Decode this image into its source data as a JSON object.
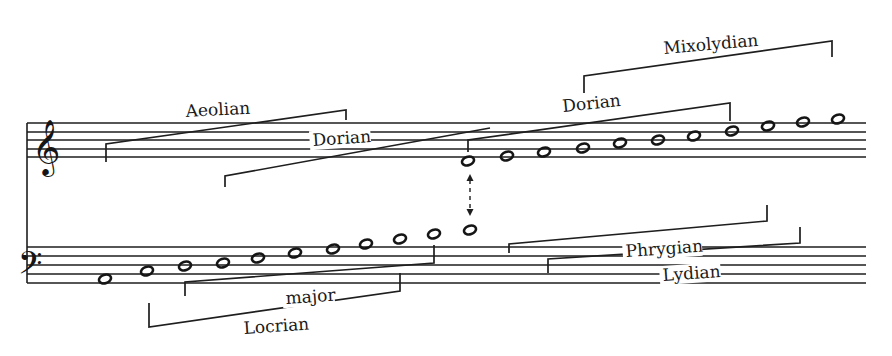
{
  "diagram": {
    "type": "music-notation-mode-diagram",
    "ink_color": "#1e1e1e",
    "background": "#ffffff",
    "clefs": [
      {
        "name": "treble",
        "glyph": "𝄞",
        "x": 46,
        "y": 163
      },
      {
        "name": "bass",
        "glyph": "𝄢",
        "x": 30,
        "y": 280
      }
    ],
    "staves": {
      "treble": {
        "x1": 27,
        "x2": 866,
        "lines_y": [
          123,
          132,
          140,
          149,
          157
        ]
      },
      "bass": {
        "x1": 27,
        "x2": 866,
        "lines_y": [
          247,
          256,
          265,
          274,
          283
        ]
      },
      "system_bar": {
        "x": 27,
        "y1": 123,
        "y2": 283
      }
    },
    "notes": {
      "treble": [
        {
          "x": 468,
          "y": 161
        },
        {
          "x": 507,
          "y": 156
        },
        {
          "x": 544,
          "y": 152
        },
        {
          "x": 583,
          "y": 148
        },
        {
          "x": 620,
          "y": 143
        },
        {
          "x": 658,
          "y": 140
        },
        {
          "x": 694,
          "y": 136
        },
        {
          "x": 732,
          "y": 131
        },
        {
          "x": 768,
          "y": 126
        },
        {
          "x": 803,
          "y": 122
        },
        {
          "x": 838,
          "y": 119
        }
      ],
      "bass": [
        {
          "x": 105,
          "y": 279
        },
        {
          "x": 147,
          "y": 271
        },
        {
          "x": 185,
          "y": 266
        },
        {
          "x": 223,
          "y": 263
        },
        {
          "x": 258,
          "y": 258
        },
        {
          "x": 295,
          "y": 253
        },
        {
          "x": 333,
          "y": 249
        },
        {
          "x": 366,
          "y": 244
        },
        {
          "x": 400,
          "y": 239
        },
        {
          "x": 434,
          "y": 234
        },
        {
          "x": 470,
          "y": 230
        }
      ]
    },
    "connector_arrow": {
      "x": 470,
      "y1": 174,
      "y2": 216,
      "style": "dashed-double-headed"
    },
    "modes": [
      {
        "label": "Aeolian",
        "points": "106,162 106,144 346,110 346,120",
        "label_x": 186,
        "label_y": 117,
        "label_rotate": -3
      },
      {
        "label": "Dorian",
        "points": "225,187 225,176 490,128",
        "label_x": 313,
        "label_y": 146,
        "label_rotate": -4
      },
      {
        "label": "Dorian",
        "points": "468,152 468,140 730,103 730,121",
        "label_x": 563,
        "label_y": 112,
        "label_rotate": -6
      },
      {
        "label": "Mixolydian",
        "points": "584,93 584,76 832,41 832,57",
        "label_x": 664,
        "label_y": 54,
        "label_rotate": -5
      },
      {
        "label": "Phrygian",
        "points": "509,253 509,244 767,221 767,205",
        "label_x": 626,
        "label_y": 257,
        "label_rotate": -4
      },
      {
        "label": "Lydian",
        "points": "548,273 548,259 800,243 800,227",
        "label_x": 663,
        "label_y": 281,
        "label_rotate": -4
      },
      {
        "label": "major",
        "points": "185,296 185,282 434,263 434,245",
        "label_x": 286,
        "label_y": 304,
        "label_rotate": -4
      },
      {
        "label": "Locrian",
        "points": "149,303 149,327 400,291 400,273",
        "label_x": 244,
        "label_y": 334,
        "label_rotate": -4
      }
    ]
  }
}
